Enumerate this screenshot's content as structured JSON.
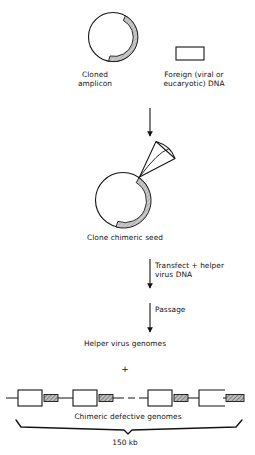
{
  "figure": {
    "title_absent": true,
    "background_color": "#ffffff",
    "ink_color": "#141414",
    "shaded_arc_color": "#b8b8b8",
    "hatch_fill_color": "#8f8f8f"
  },
  "labels": {
    "cloned_amplicon": "Cloned\namplicon",
    "foreign_dna": "Foreign (viral or\neucaryotic) DNA",
    "clone_chimeric_seed": "Clone chimeric seed",
    "transfect_helper": "Transfect + helper\nvirus DNA",
    "passage": "Passage",
    "helper_virus_genomes": "Helper virus genomes",
    "plus_sign": "+",
    "chimeric_defective_genomes": "Chimeric defective genomes",
    "size_150kb": "150 kb"
  },
  "shapes": {
    "cloned_amplicon_circle": {
      "name": "circular plasmid with shaded amplicon arc",
      "cx": 113,
      "cy": 37,
      "r": 25
    },
    "foreign_dna_box": {
      "name": "open rectangle representing foreign DNA",
      "x": 176,
      "y": 47,
      "width": 28,
      "height": 13
    },
    "chimeric_seed_circle": {
      "name": "circular chimeric seed with shaded arc and cone",
      "cx": 123,
      "cy": 200,
      "r": 28
    },
    "cone": {
      "name": "wedge cone attached to chimeric seed circle"
    }
  },
  "arrows": [
    {
      "name": "arrow-amplicon-to-seed",
      "x": 150,
      "y1": 108,
      "y2": 136
    },
    {
      "name": "arrow-transfect",
      "x": 150,
      "y1": 259,
      "y2": 288
    },
    {
      "name": "arrow-passage",
      "x": 150,
      "y1": 303,
      "y2": 332
    }
  ],
  "genome_array": {
    "name": "tandem chimeric defective genome repeats",
    "baseline_y": 398,
    "units": [
      {
        "box_x": 18,
        "box_w": 24,
        "hatch_x": 44,
        "hatch_w": 14,
        "open": false
      },
      {
        "box_x": 73,
        "box_w": 24,
        "hatch_x": 99,
        "hatch_w": 14,
        "open": false
      },
      {
        "box_x": 148,
        "box_w": 24,
        "hatch_x": 174,
        "hatch_w": 14,
        "open": false
      },
      {
        "box_x": 199,
        "box_w": 24,
        "hatch_x": 226,
        "hatch_w": 16,
        "open": true
      }
    ],
    "dashes": [
      {
        "x1": 117,
        "x2": 124
      },
      {
        "x1": 128,
        "x2": 135
      },
      {
        "x1": 139,
        "x2": 145
      }
    ]
  },
  "brace": {
    "name": "span brace for 150 kb",
    "x_left": 16,
    "x_right": 242,
    "y": 426,
    "center_x": 128
  }
}
